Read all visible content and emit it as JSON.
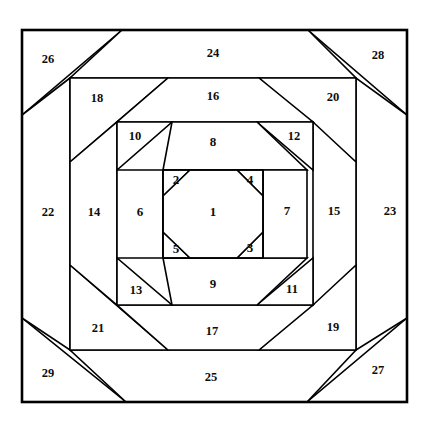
{
  "diagram": {
    "type": "quilt-block-piecing-diagram",
    "colors": {
      "background": "#ffffff",
      "line": "#000000",
      "label": "#0d0d0d"
    },
    "canvas": {
      "width": 430,
      "height": 421
    },
    "frame": {
      "x": 22,
      "y": 30,
      "width": 385,
      "height": 372
    },
    "pieces": [
      {
        "id": 1,
        "label": "1",
        "name": "center-octagon",
        "cx": 213,
        "cy": 213
      },
      {
        "id": 2,
        "label": "2",
        "name": "corner-triangle-top-left",
        "cx": 176,
        "cy": 181
      },
      {
        "id": 3,
        "label": "3",
        "name": "corner-triangle-bottom-right",
        "cx": 250,
        "cy": 249
      },
      {
        "id": 4,
        "label": "4",
        "name": "corner-triangle-top-right",
        "cx": 250,
        "cy": 181
      },
      {
        "id": 5,
        "label": "5",
        "name": "corner-triangle-bottom-left",
        "cx": 176,
        "cy": 250
      },
      {
        "id": 6,
        "label": "6",
        "name": "ring1-left-log",
        "cx": 140,
        "cy": 213
      },
      {
        "id": 7,
        "label": "7",
        "name": "ring1-right-log",
        "cx": 287,
        "cy": 212
      },
      {
        "id": 8,
        "label": "8",
        "name": "ring1-top-log",
        "cx": 213,
        "cy": 143
      },
      {
        "id": 9,
        "label": "9",
        "name": "ring1-bottom-log",
        "cx": 213,
        "cy": 285
      },
      {
        "id": 10,
        "label": "10",
        "name": "ring1-corner-top-left",
        "cx": 135,
        "cy": 137
      },
      {
        "id": 11,
        "label": "11",
        "name": "ring1-corner-bottom-right",
        "cx": 292,
        "cy": 290
      },
      {
        "id": 12,
        "label": "12",
        "name": "ring1-corner-top-right",
        "cx": 294,
        "cy": 137
      },
      {
        "id": 13,
        "label": "13",
        "name": "ring1-corner-bottom-left",
        "cx": 136,
        "cy": 291
      },
      {
        "id": 14,
        "label": "14",
        "name": "ring2-left-log",
        "cx": 94,
        "cy": 213
      },
      {
        "id": 15,
        "label": "15",
        "name": "ring2-right-log",
        "cx": 334,
        "cy": 212
      },
      {
        "id": 16,
        "label": "16",
        "name": "ring2-top-log",
        "cx": 213,
        "cy": 97
      },
      {
        "id": 17,
        "label": "17",
        "name": "ring2-bottom-log",
        "cx": 212,
        "cy": 332
      },
      {
        "id": 18,
        "label": "18",
        "name": "ring2-corner-top-left",
        "cx": 97,
        "cy": 99
      },
      {
        "id": 19,
        "label": "19",
        "name": "ring2-corner-bottom-right",
        "cx": 333,
        "cy": 328
      },
      {
        "id": 20,
        "label": "20",
        "name": "ring2-corner-top-right",
        "cx": 333,
        "cy": 98
      },
      {
        "id": 21,
        "label": "21",
        "name": "ring2-corner-bottom-left",
        "cx": 98,
        "cy": 329
      },
      {
        "id": 22,
        "label": "22",
        "name": "outer-left-log",
        "cx": 48,
        "cy": 213
      },
      {
        "id": 23,
        "label": "23",
        "name": "outer-right-log",
        "cx": 390,
        "cy": 212
      },
      {
        "id": 24,
        "label": "24",
        "name": "outer-top-log",
        "cx": 213,
        "cy": 54
      },
      {
        "id": 25,
        "label": "25",
        "name": "outer-bottom-log",
        "cx": 211,
        "cy": 378
      },
      {
        "id": 26,
        "label": "26",
        "name": "outer-corner-top-left",
        "cx": 48,
        "cy": 60
      },
      {
        "id": 27,
        "label": "27",
        "name": "outer-corner-bottom-right",
        "cx": 378,
        "cy": 371
      },
      {
        "id": 28,
        "label": "28",
        "name": "outer-corner-top-right",
        "cx": 378,
        "cy": 56
      },
      {
        "id": 29,
        "label": "29",
        "name": "outer-corner-bottom-left",
        "cx": 48,
        "cy": 374
      }
    ],
    "shapes": [
      {
        "id": 26,
        "name": "outer-corner-top-left",
        "points": "22,30 122,30 22,115"
      },
      {
        "id": 28,
        "name": "outer-corner-top-right",
        "points": "308,30 407,30 407,115"
      },
      {
        "id": 29,
        "name": "outer-corner-bottom-left",
        "points": "22,318 22,402 126,402"
      },
      {
        "id": 27,
        "name": "outer-corner-bottom-right",
        "points": "407,318 407,402 307,402"
      },
      {
        "id": 24,
        "name": "outer-top-log",
        "points": "122,30 308,30 356,78 70,78"
      },
      {
        "id": 25,
        "name": "outer-bottom-log",
        "points": "70,350 356,350 307,402 126,402"
      },
      {
        "id": 22,
        "name": "outer-left-log",
        "points": "22,115 70,78 70,350 22,318"
      },
      {
        "id": 23,
        "name": "outer-right-log",
        "points": "407,115 407,318 356,350 356,78"
      },
      {
        "id": 18,
        "name": "ring2-corner-top-left",
        "points": "70,78 168,78 70,162"
      },
      {
        "id": 20,
        "name": "ring2-corner-top-right",
        "points": "259,78 356,78 356,162"
      },
      {
        "id": 21,
        "name": "ring2-corner-bottom-left",
        "points": "70,265 70,350 168,350"
      },
      {
        "id": 19,
        "name": "ring2-corner-bottom-right",
        "points": "356,265 356,350 259,350"
      },
      {
        "id": 16,
        "name": "ring2-top-log",
        "points": "168,78 259,78 313,122 117,122"
      },
      {
        "id": 17,
        "name": "ring2-bottom-log",
        "points": "117,305 313,305 259,350 168,350"
      },
      {
        "id": 14,
        "name": "ring2-left-log",
        "points": "70,162 117,122 117,305 70,265"
      },
      {
        "id": 15,
        "name": "ring2-right-log",
        "points": "356,162 356,265 313,305 313,122"
      },
      {
        "id": 10,
        "name": "ring1-corner-top-left",
        "points": "117,122 172,122 117,170"
      },
      {
        "id": 12,
        "name": "ring1-corner-top-right",
        "points": "257,122 313,122 313,170"
      },
      {
        "id": 13,
        "name": "ring1-corner-bottom-left",
        "points": "117,258 117,305 172,305"
      },
      {
        "id": 11,
        "name": "ring1-corner-bottom-right",
        "points": "313,258 313,305 257,305"
      },
      {
        "id": 8,
        "name": "ring1-top-log",
        "points": "172,122 257,122 307,170 163,170"
      },
      {
        "id": 9,
        "name": "ring1-bottom-log",
        "points": "163,258 307,258 257,305 172,305"
      },
      {
        "id": 6,
        "name": "ring1-left-log",
        "points": "117,170 163,170 163,258 117,258"
      },
      {
        "id": 7,
        "name": "ring1-right-log",
        "points": "263,170 307,170 307,258 263,258"
      },
      {
        "id": 2,
        "name": "corner-triangle-top-left",
        "points": "163,170 190,170 163,196"
      },
      {
        "id": 4,
        "name": "corner-triangle-top-right",
        "points": "237,170 263,170 263,196"
      },
      {
        "id": 5,
        "name": "corner-triangle-bottom-left",
        "points": "163,232 163,258 190,258"
      },
      {
        "id": 3,
        "name": "corner-triangle-bottom-right",
        "points": "263,232 263,258 237,258"
      },
      {
        "id": 1,
        "name": "center-octagon",
        "points": "190,170 237,170 263,196 263,232 237,258 190,258 163,232 163,196"
      }
    ],
    "extra_lines": [
      {
        "name": "center-block-left-edge",
        "x1": 163,
        "y1": 170,
        "x2": 163,
        "y2": 258
      },
      {
        "name": "center-block-right-edge",
        "x1": 263,
        "y1": 170,
        "x2": 263,
        "y2": 258
      },
      {
        "name": "center-block-top-edge",
        "x1": 163,
        "y1": 170,
        "x2": 263,
        "y2": 170
      },
      {
        "name": "center-block-bottom-edge",
        "x1": 163,
        "y1": 258,
        "x2": 263,
        "y2": 258
      }
    ]
  }
}
